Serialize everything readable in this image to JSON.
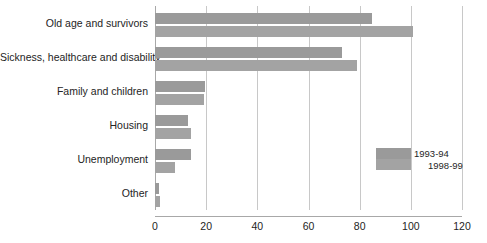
{
  "chart_data": {
    "type": "bar",
    "orientation": "horizontal",
    "title": "",
    "subtitle": "",
    "xlabel": "",
    "ylabel": "",
    "xlim": [
      0,
      120
    ],
    "xticks": [
      "0",
      "20",
      "40",
      "60",
      "80",
      "100",
      "120"
    ],
    "xtick_values": [
      0,
      20,
      40,
      60,
      80,
      100,
      120
    ],
    "grid": true,
    "legend_position": "middle-right",
    "categories": [
      "Old age and survivors",
      "Sickness, healthcare and disability",
      "Family and children",
      "Housing",
      "Unemployment",
      "Other"
    ],
    "series": [
      {
        "name": "1993-94",
        "color": "#9a9a9a",
        "values": [
          85,
          73,
          19.5,
          13,
          14,
          1.5
        ]
      },
      {
        "name": "1998-99",
        "color": "#a3a3a3",
        "values": [
          101,
          79,
          19,
          14,
          8,
          2
        ]
      }
    ]
  },
  "legend": {
    "items": [
      {
        "label": "1993-94"
      },
      {
        "label": "1998-99"
      }
    ]
  }
}
